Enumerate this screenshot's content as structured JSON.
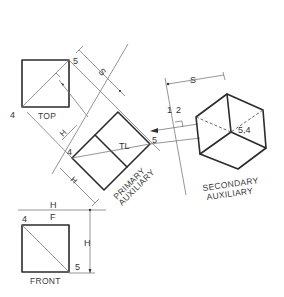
{
  "views": {
    "top": {
      "label": "TOP",
      "point_a": "4",
      "point_b": "5"
    },
    "front": {
      "label": "FRONT",
      "point_a": "4",
      "point_b": "5"
    },
    "primary_auxiliary": {
      "label_line1": "PRIMARY",
      "label_line2": "AUXILIARY",
      "point_a": "4",
      "point_b": "5",
      "true_length": "TL"
    },
    "secondary_auxiliary": {
      "label_line1": "SECONDARY",
      "label_line2": "AUXILIARY",
      "point": "5,4"
    }
  },
  "fold_lines": {
    "hf": {
      "upper": "H",
      "lower": "F"
    },
    "one_two": {
      "left": "1",
      "right": "2"
    }
  },
  "dimensions": {
    "top_s": "S",
    "secondary_s": "S",
    "primary_h_upper": "H",
    "primary_h_lower": "H",
    "front_h": "H"
  },
  "colors": {
    "object_line": "#2b2b2b",
    "construction_line": "#7a7a7a",
    "background": "#ffffff"
  }
}
